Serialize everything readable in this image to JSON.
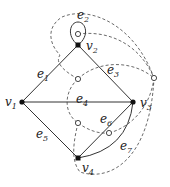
{
  "diagram": {
    "vertices": [
      {
        "id": "v1",
        "name": "v",
        "sub": "1",
        "x": 22,
        "y": 102,
        "lx": 5,
        "ly": 106
      },
      {
        "id": "v2",
        "name": "v",
        "sub": "2",
        "x": 78,
        "y": 45,
        "lx": 86,
        "ly": 50
      },
      {
        "id": "v3",
        "name": "v",
        "sub": "3",
        "x": 133,
        "y": 102,
        "lx": 140,
        "ly": 107
      },
      {
        "id": "v4",
        "name": "v",
        "sub": "4",
        "x": 78,
        "y": 158,
        "lx": 82,
        "ly": 172
      }
    ],
    "edges": [
      {
        "id": "e1",
        "name": "e",
        "sub": "1",
        "lx": 37,
        "ly": 78
      },
      {
        "id": "e2",
        "name": "e",
        "sub": "2",
        "lx": 77,
        "ly": 19
      },
      {
        "id": "e3",
        "name": "e",
        "sub": "3",
        "lx": 107,
        "ly": 74
      },
      {
        "id": "e4",
        "name": "e",
        "sub": "4",
        "lx": 76,
        "ly": 103
      },
      {
        "id": "e5",
        "name": "e",
        "sub": "5",
        "lx": 36,
        "ly": 138
      },
      {
        "id": "e6",
        "name": "e",
        "sub": "6",
        "lx": 100,
        "ly": 123
      },
      {
        "id": "e7",
        "name": "e",
        "sub": "7",
        "lx": 120,
        "ly": 150
      }
    ],
    "dual_vertices": [
      {
        "id": "f-loop",
        "x": 78,
        "y": 34
      },
      {
        "id": "f-top",
        "x": 78,
        "y": 79
      },
      {
        "id": "f-outer",
        "x": 154,
        "y": 78
      },
      {
        "id": "f-lower",
        "x": 78,
        "y": 123
      },
      {
        "id": "f-e6e7",
        "x": 109,
        "y": 133
      }
    ]
  }
}
